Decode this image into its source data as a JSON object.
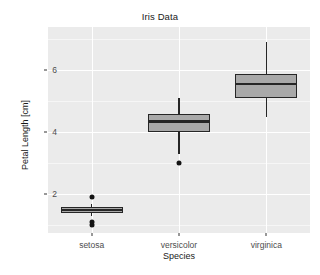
{
  "chart_data": {
    "type": "box",
    "title": "Iris Data",
    "xlabel": "Species",
    "ylabel": "Petal Length [cm]",
    "categories": [
      "setosa",
      "versicolor",
      "virginica"
    ],
    "ylim": [
      0.75,
      7.4
    ],
    "ytick_values": [
      2,
      4,
      6
    ],
    "ytick_labels": [
      "2",
      "4",
      "6"
    ],
    "grid": true,
    "legend": "none",
    "theme": "grey",
    "colors": {
      "panel_background": "#ebebeb",
      "gridline_major": "#ffffff",
      "box_fill": "#a9a9a9",
      "box_stroke": "#262626",
      "outlier": "#141414",
      "text": "#1a1a1a",
      "tick_text": "#4d4d4d"
    },
    "boxes": [
      {
        "category": "setosa",
        "lower_whisker": 1.3,
        "q1": 1.4,
        "median": 1.5,
        "q3": 1.575,
        "upper_whisker": 1.7,
        "outliers": [
          1.0,
          1.1,
          1.9
        ]
      },
      {
        "category": "versicolor",
        "lower_whisker": 3.3,
        "q1": 4.0,
        "median": 4.35,
        "q3": 4.6,
        "upper_whisker": 5.1,
        "outliers": [
          3.0
        ]
      },
      {
        "category": "virginica",
        "lower_whisker": 4.5,
        "q1": 5.1,
        "median": 5.55,
        "q3": 5.875,
        "upper_whisker": 6.9,
        "outliers": []
      }
    ]
  }
}
